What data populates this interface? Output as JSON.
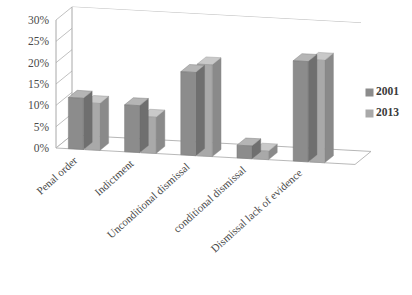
{
  "chart_data": {
    "type": "bar",
    "title": "",
    "subtitle": "",
    "xlabel": "",
    "ylabel": "",
    "categories": [
      "Penal order",
      "Indictment",
      "Unconditional dismissal",
      "conditional dismissal",
      "Dismissal lack of evidence"
    ],
    "series": [
      {
        "name": "2001",
        "values": [
          12,
          11,
          19.5,
          3,
          23.5
        ],
        "color": "#8c8c8c"
      },
      {
        "name": "2013",
        "values": [
          11,
          8.5,
          21.5,
          2,
          24
        ],
        "color": "#a9a9a9"
      }
    ],
    "ylim": [
      0,
      30
    ],
    "yticks": [
      0,
      5,
      10,
      15,
      20,
      25,
      30
    ],
    "ytick_labels": [
      "0%",
      "5%",
      "10%",
      "15%",
      "20%",
      "25%",
      "30%"
    ],
    "grid": true,
    "legend_position": "right",
    "style": "3d-column"
  },
  "legend": {
    "items": [
      {
        "label": "2001",
        "swatch_color": "#8c8c8c"
      },
      {
        "label": "2013",
        "swatch_color": "#a9a9a9"
      }
    ]
  },
  "colors": {
    "background": "#ffffff",
    "gridline": "#b9b9b9",
    "text": "#3a3a3a",
    "series_2001_front": "#8c8c8c",
    "series_2001_top": "#b5b5b5",
    "series_2001_side": "#6f6f6f",
    "series_2013_front": "#a9a9a9",
    "series_2013_top": "#c9c9c9",
    "series_2013_side": "#8a8a8a"
  }
}
